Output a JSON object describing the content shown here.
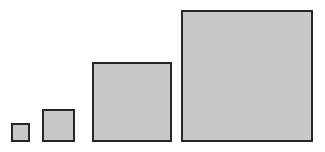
{
  "figure": {
    "background_color": "#ffffff",
    "width": 325,
    "height": 152,
    "baseline_y": 142
  },
  "style": {
    "fill_color": "#c8c8c8",
    "border_color": "#262626",
    "border_width": 2
  },
  "chart_data": {
    "type": "bar",
    "title": "",
    "subtitle": "",
    "xlabel": "",
    "ylabel": "",
    "orientation": "vertical",
    "grid": false,
    "legend": false,
    "legend_position": "none",
    "axis_visible": false,
    "tick_labels_visible": false,
    "categories": [
      "1",
      "2",
      "3",
      "4"
    ],
    "values": [
      19,
      33,
      80,
      132
    ],
    "value_unit": "px",
    "ylim": [
      0,
      136
    ],
    "xlim": [
      0,
      325
    ],
    "series": [
      {
        "name": "square-size",
        "values": [
          19,
          33,
          80,
          132
        ],
        "color": "#c8c8c8",
        "edge_color": "#262626"
      }
    ],
    "annotations": [],
    "note": "Four squares of increasing side length aligned on a common bottom baseline."
  },
  "squares": [
    {
      "id": "square-1",
      "label": "",
      "left": 11,
      "bottom": 10,
      "size": 19
    },
    {
      "id": "square-2",
      "label": "",
      "left": 42,
      "bottom": 10,
      "size": 33
    },
    {
      "id": "square-3",
      "label": "",
      "left": 92,
      "bottom": 10,
      "size": 80
    },
    {
      "id": "square-4",
      "label": "",
      "left": 181,
      "bottom": 10,
      "size": 132
    }
  ]
}
